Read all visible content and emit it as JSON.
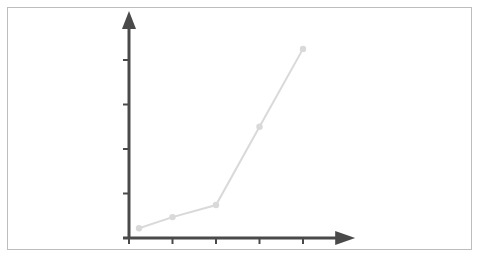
{
  "chart_data": {
    "type": "line",
    "title": "",
    "xlabel": "",
    "ylabel": "",
    "x": [
      0.23,
      1,
      2,
      3,
      4
    ],
    "series": [
      {
        "name": "series-1",
        "values": [
          0.22,
          0.47,
          0.74,
          2.5,
          4.25
        ],
        "color": "#d9d9d9"
      }
    ],
    "xlim": [
      0,
      5.2
    ],
    "ylim": [
      0,
      5.1
    ],
    "x_ticks": [
      0,
      1,
      2,
      3,
      4
    ],
    "y_ticks": [
      0,
      1,
      2,
      3,
      4
    ],
    "x_tick_labels": [],
    "y_tick_labels": [],
    "grid": false,
    "legend": "none",
    "axis_color": "#4a4a4a",
    "frame_color": "#bdbdbd"
  }
}
